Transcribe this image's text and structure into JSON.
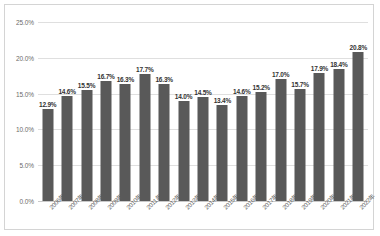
{
  "chart_data": {
    "type": "bar",
    "title": "",
    "subtitle": "",
    "xlabel": "",
    "ylabel": "",
    "ylim": [
      0,
      25
    ],
    "ytick_labels": [
      "0.0%",
      "5.0%",
      "10.0%",
      "15.0%",
      "20.0%",
      "25.0%"
    ],
    "ytick_values": [
      0,
      5,
      10,
      15,
      20,
      25
    ],
    "grid": true,
    "legend": "none",
    "value_suffix": "%",
    "categories": [
      "2006年",
      "2007年",
      "2008年",
      "2009年",
      "2010年",
      "2011年",
      "2012年",
      "2013年",
      "2014年",
      "2015年",
      "2016年",
      "2017年",
      "2018年",
      "2019年",
      "2020年",
      "2021年",
      "2022年"
    ],
    "values": [
      12.9,
      14.6,
      15.5,
      16.7,
      16.3,
      17.7,
      16.3,
      14.0,
      14.5,
      13.4,
      14.6,
      15.2,
      17.0,
      15.7,
      17.9,
      18.4,
      20.8
    ],
    "data_labels": [
      "12.9%",
      "14.6%",
      "15.5%",
      "16.7%",
      "16.3%",
      "17.7%",
      "16.3%",
      "14.0%",
      "14.5%",
      "13.4%",
      "14.6%",
      "15.2%",
      "17.0%",
      "15.7%",
      "17.9%",
      "18.4%",
      "20.8%"
    ],
    "colors": {
      "bar": "#595959",
      "gridline": "#dfdfdf",
      "baseline": "#c9c9c9",
      "axis_text": "#6b6b6b",
      "data_label_text": "#333333",
      "border": "#d4d4d4",
      "background": "#ffffff"
    }
  }
}
